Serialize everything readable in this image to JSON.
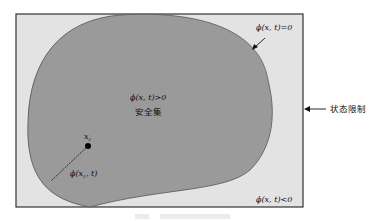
{
  "diagram": {
    "labels": {
      "boundary": "ϕ(x, t)=0",
      "inside": "ϕ(x, t)>0",
      "safe_set": "安全集",
      "point": "x",
      "point_sub": "c",
      "distance": "ϕ(x",
      "distance_sub": "c",
      "distance_tail": ", t)",
      "outside": "ϕ(x, t)<0",
      "state_constraint": "状态限制"
    },
    "colors": {
      "background_region": "#e3e3e3",
      "safe_set_fill": "#9a9a9a",
      "border": "#333333",
      "point": "#000000"
    }
  }
}
